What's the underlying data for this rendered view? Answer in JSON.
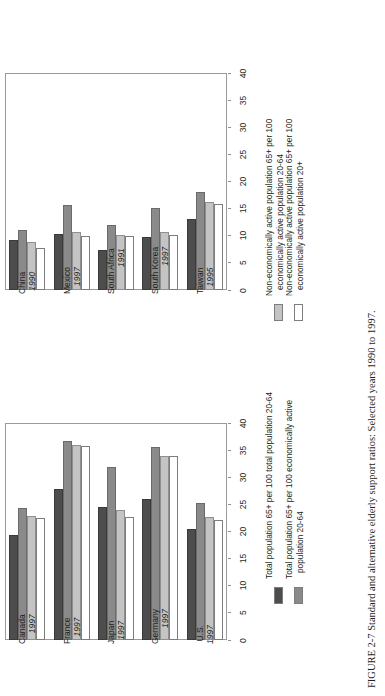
{
  "caption": {
    "figure_number": "FIGURE 2-7",
    "text": "Standard and alternative elderly support ratios: Selected years 1990 to 1997."
  },
  "axis": {
    "ticks": [
      "0",
      "5",
      "10",
      "15",
      "20",
      "25",
      "30",
      "35",
      "40"
    ],
    "min": 0,
    "max": 40
  },
  "chart_data": [
    {
      "id": "developing",
      "type": "bar",
      "title": "",
      "xlabel": "",
      "ylabel": "",
      "ylim": [
        0,
        40
      ],
      "grid": false,
      "orientation": "horizontal",
      "legend_position": "right",
      "categories": [
        "China",
        "Mexico",
        "South Africa",
        "South Korea",
        "Taiwan"
      ],
      "category_years": [
        "1990",
        "1997",
        "1991",
        "1997",
        "1995"
      ],
      "series": [
        {
          "name": "Total population 65+ per 100 total population 20-64",
          "color": "#4d4d4d",
          "values": [
            9.2,
            10.3,
            7.4,
            9.8,
            13.0
          ]
        },
        {
          "name": "Total population 65+ per 100 economically active population 20-64",
          "color": "#8a8a8a",
          "values": [
            11.0,
            15.6,
            12.0,
            15.2,
            18.0
          ]
        },
        {
          "name": "Non-economically active population 65+ per 100 economically active population 20-64",
          "color": "#c4c4c4",
          "values": [
            8.8,
            10.6,
            10.2,
            10.7,
            16.3
          ]
        },
        {
          "name": "Non-economically active population 65+ per 100 economically active population 20+",
          "color": "#ffffff",
          "values": [
            7.7,
            9.9,
            10.0,
            10.1,
            15.8
          ]
        }
      ],
      "legend_entries": [
        {
          "swatch": "#c4c4c4",
          "line1": "Non-economically active population 65+ per 100",
          "line2": "economically active population 20-64"
        },
        {
          "swatch": "#ffffff",
          "line1": "Non-economically active population 65+ per 100",
          "line2": "economically active population 20+"
        }
      ]
    },
    {
      "id": "developed",
      "type": "bar",
      "title": "",
      "xlabel": "",
      "ylabel": "",
      "ylim": [
        0,
        40
      ],
      "grid": false,
      "orientation": "horizontal",
      "legend_position": "right",
      "categories": [
        "Canada",
        "France",
        "Japan",
        "Germany",
        "U.S."
      ],
      "category_years": [
        "1997",
        "1997",
        "1997",
        "1997",
        "1997"
      ],
      "series": [
        {
          "name": "Total population 65+ per 100 total population 20-64",
          "color": "#4d4d4d",
          "values": [
            19.4,
            27.8,
            24.6,
            25.9,
            20.4
          ]
        },
        {
          "name": "Total population 65+ per 100 economically active population 20-64",
          "color": "#8a8a8a",
          "values": [
            24.3,
            36.6,
            31.9,
            35.6,
            25.3
          ]
        },
        {
          "name": "Non-economically active population 65+ per 100 economically active population 20-64",
          "color": "#c4c4c4",
          "values": [
            22.8,
            35.9,
            23.9,
            34.0,
            22.6
          ]
        },
        {
          "name": "Non-economically active population 65+ per 100 economically active population 20+",
          "color": "#ffffff",
          "values": [
            22.5,
            35.7,
            22.6,
            33.9,
            22.1
          ]
        }
      ],
      "legend_entries": [
        {
          "swatch": "#4d4d4d",
          "line1": "Total population 65+ per 100 total population 20-64",
          "line2": ""
        },
        {
          "swatch": "#8a8a8a",
          "line1": "Total population 65+ per 100 economically active",
          "line2": "population 20-64"
        }
      ]
    }
  ]
}
